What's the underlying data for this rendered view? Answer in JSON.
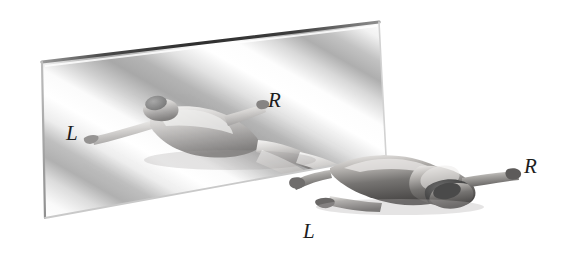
{
  "figure": {
    "background_color": "#ffffff",
    "width": 565,
    "height": 271
  },
  "mirror": {
    "name": "mirror-plane",
    "shape": "parallelogram",
    "corners": {
      "top_left": [
        42,
        62
      ],
      "top_right": [
        379,
        22
      ],
      "bottom_right": [
        386,
        156
      ],
      "bottom_left": [
        45,
        218
      ]
    },
    "surface": "diagonal-soft-gradient-bands",
    "band_direction": "upper-right to lower-left",
    "edge_color": "#3a3a3a",
    "fill_light": "#ffffff",
    "fill_shade": "#b9b9b9"
  },
  "labels": [
    {
      "id": "label-mirror-left",
      "text": "L",
      "belongs_to": "reflected-figure",
      "marks": "outstretched hand at far left inside mirror",
      "color": "#1d1d1d",
      "position": [
        66,
        123
      ]
    },
    {
      "id": "label-mirror-right",
      "text": "R",
      "belongs_to": "reflected-figure",
      "marks": "hand toward centre-right inside mirror",
      "color": "#1d1d1d",
      "position": [
        268,
        90
      ]
    },
    {
      "id": "label-real-right",
      "text": "R",
      "belongs_to": "real-figure",
      "marks": "outstretched hand at far right of real figure",
      "color": "#1d1d1d",
      "position": [
        524,
        156
      ]
    },
    {
      "id": "label-real-left",
      "text": "L",
      "belongs_to": "real-figure",
      "marks": "outstretched hand at lower left of real figure",
      "color": "#1d1d1d",
      "position": [
        303,
        221
      ]
    }
  ],
  "figures": [
    {
      "id": "reflected-figure",
      "name": "reflected-human-figure",
      "location": "inside mirror plane",
      "pose": "prone, arms outstretched",
      "tone": "light grey, partially washed out by mirror highlights"
    },
    {
      "id": "real-figure",
      "name": "real-human-figure",
      "location": "in front of and below the mirror, lower right",
      "pose": "prone, arms outstretched, head to the right",
      "tone": "mid to dark grey with specular highlights"
    }
  ],
  "palette": {
    "ink": "#1d1d1d",
    "mirror_edge": "#3a3a3a",
    "skin_light": "#e6e4e2",
    "skin_mid": "#9c9a98",
    "skin_dark": "#4e4c4b",
    "hair_dark": "#454545",
    "background": "#ffffff"
  }
}
